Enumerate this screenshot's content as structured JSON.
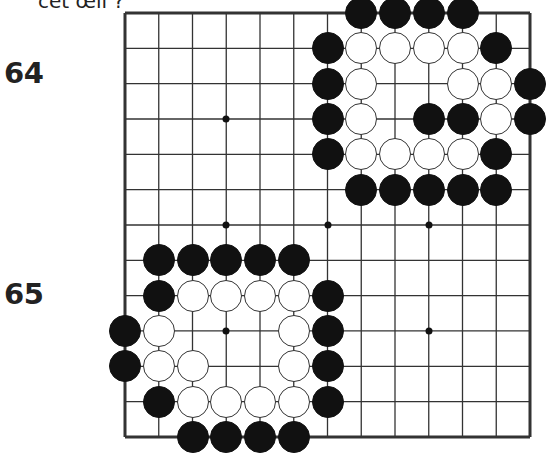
{
  "caption": "cet œil ?",
  "problems": [
    {
      "number": "64",
      "label_y": 58
    },
    {
      "number": "65",
      "label_y": 279
    }
  ],
  "board": {
    "size": 13,
    "origin": {
      "x": 125,
      "y": 13
    },
    "spacing": {
      "x": 33.75,
      "y": 35.33
    },
    "line_color": "#333333",
    "border_width": 3,
    "line_width": 1.3,
    "star_points": [
      [
        3,
        3
      ],
      [
        3,
        6
      ],
      [
        6,
        6
      ],
      [
        9,
        6
      ],
      [
        3,
        9
      ],
      [
        9,
        9
      ],
      [
        9,
        3
      ]
    ],
    "stones": {
      "black": [
        [
          7,
          0
        ],
        [
          8,
          0
        ],
        [
          9,
          0
        ],
        [
          10,
          0
        ],
        [
          6,
          1
        ],
        [
          11,
          1
        ],
        [
          6,
          2
        ],
        [
          12,
          2
        ],
        [
          6,
          3
        ],
        [
          9,
          3
        ],
        [
          10,
          3
        ],
        [
          12,
          3
        ],
        [
          6,
          4
        ],
        [
          11,
          4
        ],
        [
          7,
          5
        ],
        [
          8,
          5
        ],
        [
          9,
          5
        ],
        [
          10,
          5
        ],
        [
          11,
          5
        ],
        [
          1,
          7
        ],
        [
          2,
          7
        ],
        [
          3,
          7
        ],
        [
          4,
          7
        ],
        [
          5,
          7
        ],
        [
          1,
          8
        ],
        [
          6,
          8
        ],
        [
          0,
          9
        ],
        [
          6,
          9
        ],
        [
          0,
          10
        ],
        [
          6,
          10
        ],
        [
          1,
          11
        ],
        [
          6,
          11
        ],
        [
          2,
          12
        ],
        [
          3,
          12
        ],
        [
          4,
          12
        ],
        [
          5,
          12
        ]
      ],
      "white": [
        [
          7,
          1
        ],
        [
          8,
          1
        ],
        [
          9,
          1
        ],
        [
          10,
          1
        ],
        [
          7,
          2
        ],
        [
          10,
          2
        ],
        [
          11,
          2
        ],
        [
          7,
          3
        ],
        [
          11,
          3
        ],
        [
          7,
          4
        ],
        [
          8,
          4
        ],
        [
          9,
          4
        ],
        [
          10,
          4
        ],
        [
          2,
          8
        ],
        [
          3,
          8
        ],
        [
          4,
          8
        ],
        [
          5,
          8
        ],
        [
          1,
          9
        ],
        [
          5,
          9
        ],
        [
          1,
          10
        ],
        [
          2,
          10
        ],
        [
          5,
          10
        ],
        [
          2,
          11
        ],
        [
          3,
          11
        ],
        [
          4,
          11
        ],
        [
          5,
          11
        ]
      ]
    }
  }
}
